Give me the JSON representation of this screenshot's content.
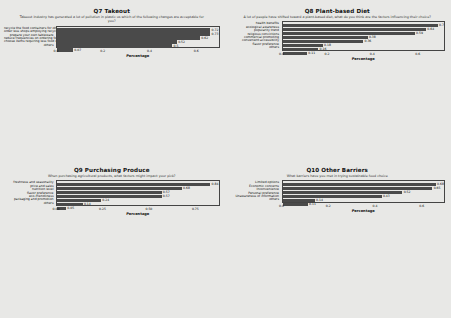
{
  "page": {
    "background": "#e8e8e6",
    "bar_color": "#4a4a4a",
    "layout": "2x2 grid of horizontal bar charts"
  },
  "chart_data": [
    {
      "id": "q7",
      "type": "bar",
      "orientation": "horizontal",
      "title": "Q7 Takeout",
      "subtitle": "Takeout industry has generated a lot of pollution in plastic us which of the following changes are acceptable for you?",
      "xlabel": "Percentage",
      "ylabel": "",
      "xlim": [
        0,
        0.7
      ],
      "xticks": [
        "0.0",
        "0.2",
        "0.4",
        "0.6"
      ],
      "xtick_values": [
        0.0,
        0.2,
        0.4,
        0.6
      ],
      "grid": false,
      "categories": [
        "recycle the food containers for other storage",
        "order less shops employing recyclable packaging",
        "prepare your own tableware",
        "reduce frequencies on ordering food",
        "choose items requiring less food wrap",
        "others"
      ],
      "values": [
        0.72,
        0.73,
        0.62,
        0.52,
        0.5,
        0.07
      ],
      "value_labels": [
        "0.72",
        "0.73",
        "0.62",
        "0.52",
        "0.5",
        "0.07"
      ]
    },
    {
      "id": "q8",
      "type": "bar",
      "orientation": "horizontal",
      "title": "Q8 Plant-based Diet",
      "subtitle": "A lot of people have shifted toward a plant-based diet, what do you think are the factors influencing their choice?",
      "xlabel": "Percentage",
      "ylabel": "",
      "xlim": [
        0,
        0.72
      ],
      "xticks": [
        "0.0",
        "0.2",
        "0.4",
        "0.6"
      ],
      "xtick_values": [
        0.0,
        0.2,
        0.4,
        0.6
      ],
      "grid": false,
      "categories": [
        "health benefits",
        "ecological awareness",
        "popularity trend",
        "religious convictions",
        "commercial promoting",
        "convenient accessibility",
        "flavor preference",
        "others"
      ],
      "values": [
        0.7,
        0.64,
        0.59,
        0.38,
        0.36,
        0.18,
        0.16,
        0.11
      ],
      "value_labels": [
        "0.7",
        "0.64",
        "0.59",
        "0.38",
        "0.36",
        "0.18",
        "0.16",
        "0.11"
      ]
    },
    {
      "id": "q9",
      "type": "bar",
      "orientation": "horizontal",
      "title": "Q9 Purchasing Produce",
      "subtitle": "When purchasing agricultural products, what factors might impact your pick?",
      "xlabel": "Percentage",
      "ylabel": "",
      "xlim": [
        0,
        0.88
      ],
      "xticks": [
        "0.00",
        "0.25",
        "0.50",
        "0.75"
      ],
      "xtick_values": [
        0.0,
        0.25,
        0.5,
        0.75
      ],
      "grid": false,
      "categories": [
        "freshness and seasonality",
        "price and sales",
        "nutrition level",
        "flavor preference",
        "eco-friendliness",
        "packaging and promotion",
        "others"
      ],
      "values": [
        0.84,
        0.68,
        0.57,
        0.57,
        0.24,
        0.14,
        0.05
      ],
      "value_labels": [
        "0.84",
        "0.68",
        "0.57",
        "0.57",
        "0.24",
        "0.14",
        "0.05"
      ]
    },
    {
      "id": "q10",
      "type": "bar",
      "orientation": "horizontal",
      "title": "Q10 Other Barriers",
      "subtitle": "What barriers have you met in trying sustainable food choice",
      "xlabel": "Percentage",
      "ylabel": "",
      "xlim": [
        0,
        0.7
      ],
      "xticks": [
        "0.0",
        "0.2",
        "0.4",
        "0.6"
      ],
      "xtick_values": [
        0.0,
        0.2,
        0.4,
        0.6
      ],
      "grid": false,
      "categories": [
        "Limited options",
        "Economic concerns",
        "Inconvenience",
        "Personal preference",
        "Unawareness of information",
        "others"
      ],
      "values": [
        0.68,
        0.65,
        0.52,
        0.43,
        0.14,
        0.11
      ],
      "value_labels": [
        "0.68",
        "0.65",
        "0.52",
        "0.43",
        "0.14",
        "0.11"
      ]
    }
  ]
}
